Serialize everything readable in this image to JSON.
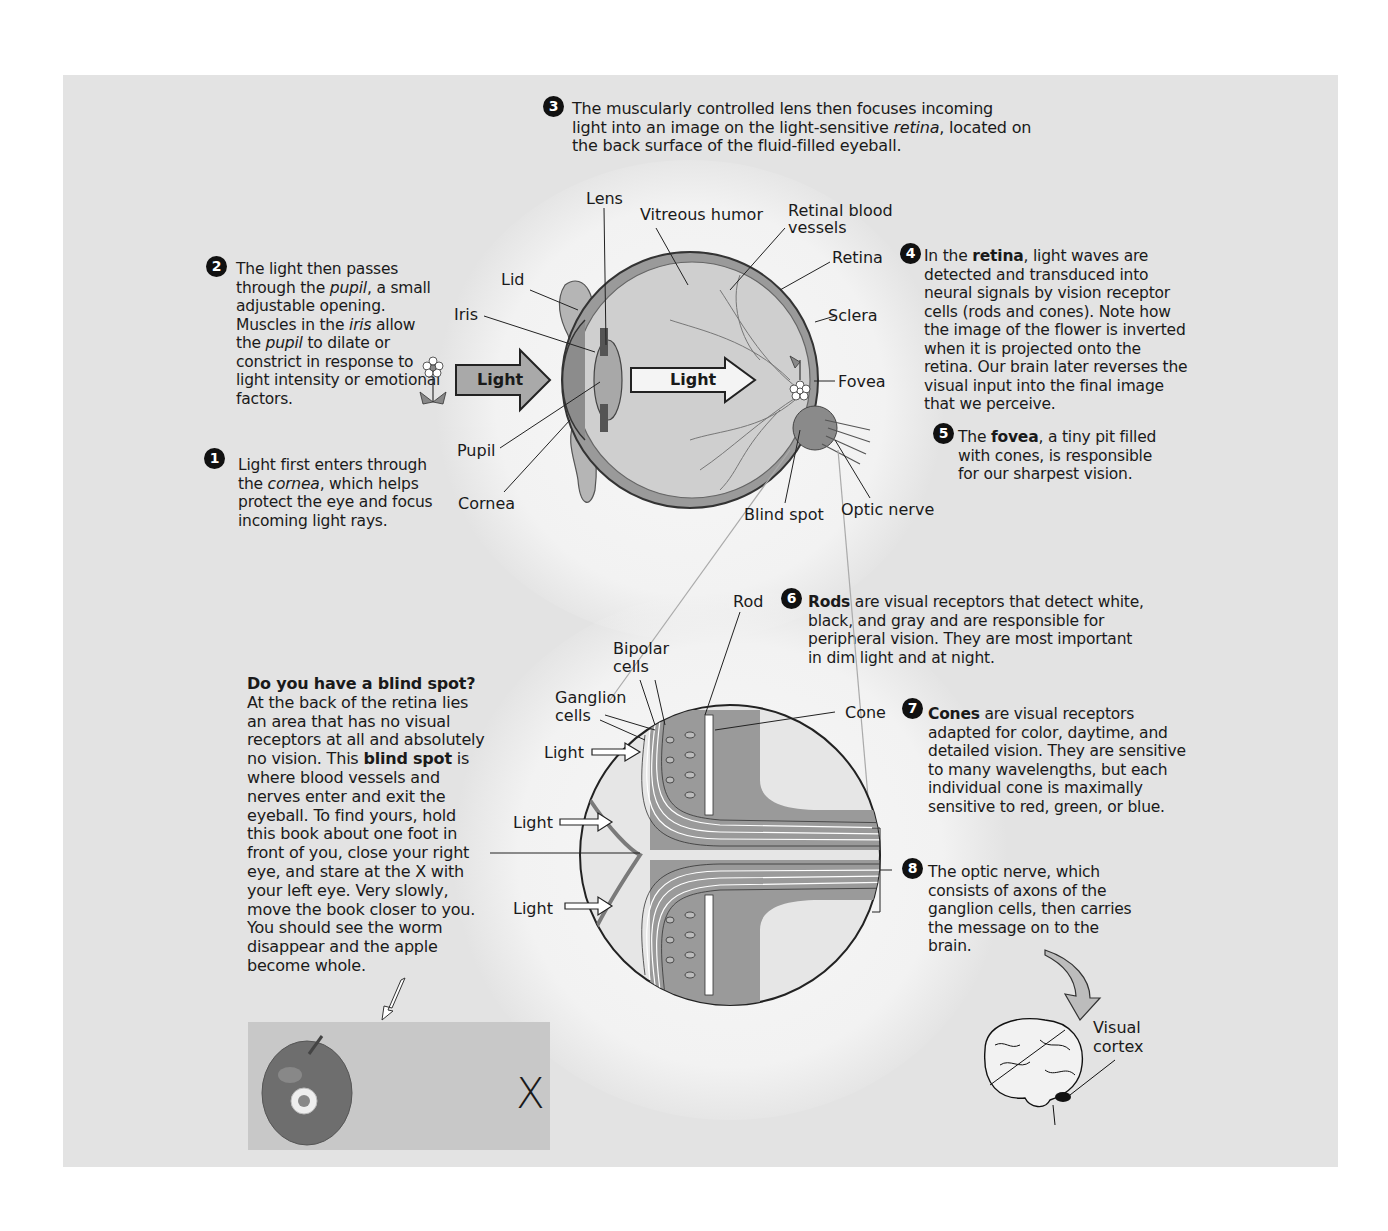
{
  "steps": {
    "s1": {
      "num": "1",
      "pre": "Light first enters through the ",
      "em": "cornea",
      "post": ", which helps protect the eye and focus incoming light rays."
    },
    "s2": {
      "num": "2",
      "t1": "The light then passes through the ",
      "em1": "pupil",
      "t2": ", a small adjustable opening. Muscles in the ",
      "em2": "iris",
      "t3": " allow the ",
      "em3": "pupil",
      "t4": " to dilate or constrict in response to light intensity or emotional factors."
    },
    "s3": {
      "num": "3",
      "pre": "The muscularly controlled lens then focuses incoming light into an image on the light-sensitive ",
      "em": "retina",
      "post": ", located on the back surface of the fluid-filled eyeball."
    },
    "s4": {
      "num": "4",
      "pre": "In the ",
      "bold": "retina",
      "post": ", light waves are detected and transduced into neural signals by vision receptor cells (rods and cones). Note how the image of the flower is inverted when it is projected onto the retina. Our brain later reverses the visual input into the final image that we perceive."
    },
    "s5": {
      "num": "5",
      "pre": "The ",
      "bold": "fovea",
      "post": ", a tiny pit filled with cones, is responsible for our sharpest vision."
    },
    "s6": {
      "num": "6",
      "bold": "Rods",
      "post": " are visual receptors that detect white, black, and gray and are responsible for peripheral vision. They are most important in dim light and at night."
    },
    "s7": {
      "num": "7",
      "bold": "Cones",
      "post": " are visual receptors adapted for color, daytime, and detailed vision. They are sensitive to many wavelengths, but each individual cone is maximally sensitive to red, green, or blue."
    },
    "s8": {
      "num": "8",
      "text": "The optic nerve, which consists of axons of the ganglion cells, then carries the message on to the brain."
    }
  },
  "eye_labels": {
    "lens": "Lens",
    "vitreous": "Vitreous humor",
    "retinal_vessels_1": "Retinal blood",
    "retinal_vessels_2": "vessels",
    "retina": "Retina",
    "lid": "Lid",
    "iris": "Iris",
    "sclera": "Sclera",
    "fovea": "Fovea",
    "pupil": "Pupil",
    "cornea": "Cornea",
    "blind_spot": "Blind spot",
    "optic_nerve": "Optic nerve",
    "light_outer": "Light",
    "light_inner": "Light"
  },
  "retina_labels": {
    "rod": "Rod",
    "bipolar_1": "Bipolar",
    "bipolar_2": "cells",
    "ganglion_1": "Ganglion",
    "ganglion_2": "cells",
    "cone": "Cone",
    "light_1": "Light",
    "light_2": "Light",
    "light_3": "Light"
  },
  "blind_spot_box": {
    "title": "Do you have a blind spot?",
    "p1": "At the back of the retina lies an area that has no visual receptors at all and absolutely no vision. This ",
    "bold": "blind spot",
    "p2": " is where blood vessels and nerves enter and exit the eyeball. To find yours, hold this book about one foot in front of you, close your right eye, and stare at the X with your left eye. Very slowly, move the book closer to you. You should see the worm disappear and the apple become whole.",
    "x_mark": "X"
  },
  "brain": {
    "visual_1": "Visual",
    "visual_2": "cortex"
  },
  "colors": {
    "panel": "#e3e3e3",
    "ink": "#1a1a1a",
    "eye_fill": "#c9c9c9",
    "sclera": "#8a8a8a"
  }
}
